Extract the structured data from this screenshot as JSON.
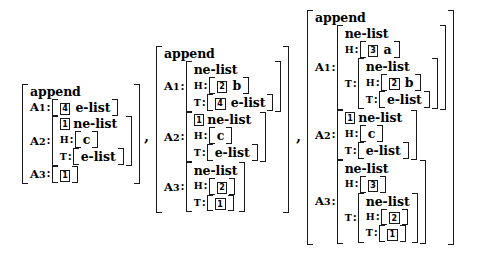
{
  "figure": {
    "kind": "attribute-value-matrix-sequence",
    "separators": [
      ",",
      ","
    ],
    "type_names": {
      "append": "append",
      "ne_list": "ne-list",
      "e_list": "e-list"
    },
    "attributes": {
      "a1": "A1",
      "a2": "A2",
      "a3": "A3",
      "head": "H",
      "tail": "T",
      "colon": ":"
    },
    "atoms": {
      "a": "a",
      "b": "b",
      "c": "c"
    },
    "tags": {
      "t1": "1",
      "t2": "2",
      "t3": "3",
      "t4": "4"
    }
  },
  "avms": [
    {
      "id": "avm-1",
      "type": "append",
      "a1": {
        "tag": "4",
        "atom": "e-list"
      },
      "a2": {
        "tag": "1",
        "type": "ne-list",
        "head": {
          "atom": "c"
        },
        "tail": {
          "atom": "e-list"
        }
      },
      "a3": {
        "tag": "1"
      }
    },
    {
      "id": "avm-2",
      "type": "append",
      "a1": {
        "type": "ne-list",
        "head": {
          "tag": "2",
          "atom": "b"
        },
        "tail": {
          "tag": "4",
          "atom": "e-list"
        }
      },
      "a2": {
        "tag": "1",
        "type": "ne-list",
        "head": {
          "atom": "c"
        },
        "tail": {
          "atom": "e-list"
        }
      },
      "a3": {
        "type": "ne-list",
        "head": {
          "tag": "2"
        },
        "tail": {
          "tag": "1"
        }
      }
    },
    {
      "id": "avm-3",
      "type": "append",
      "a1": {
        "type": "ne-list",
        "head": {
          "tag": "3",
          "atom": "a"
        },
        "tail": {
          "type": "ne-list",
          "head": {
            "tag": "2",
            "atom": "b"
          },
          "tail": {
            "atom": "e-list"
          }
        }
      },
      "a2": {
        "tag": "1",
        "type": "ne-list",
        "head": {
          "atom": "c"
        },
        "tail": {
          "atom": "e-list"
        }
      },
      "a3": {
        "type": "ne-list",
        "head": {
          "tag": "3"
        },
        "tail": {
          "type": "ne-list",
          "head": {
            "tag": "2"
          },
          "tail": {
            "tag": "1"
          }
        }
      }
    }
  ]
}
